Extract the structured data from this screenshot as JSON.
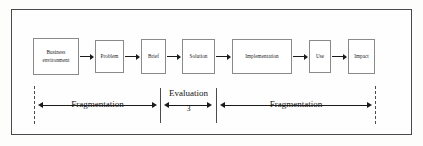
{
  "diagram": {
    "frame_color": "#4a4a4a",
    "line_color": "#1b1b1b",
    "stages": [
      {
        "id": "business-environment",
        "label_line1": "Business",
        "label_line2": "environment",
        "x": 33,
        "y": 38,
        "w": 46,
        "h": 37
      },
      {
        "id": "problem",
        "label_line1": "Problem",
        "label_line2": "",
        "x": 95,
        "y": 40,
        "w": 29,
        "h": 33
      },
      {
        "id": "brief",
        "label_line1": "Brief",
        "label_line2": "",
        "x": 141,
        "y": 39,
        "w": 25,
        "h": 35
      },
      {
        "id": "solution",
        "label_line1": "Solution",
        "label_line2": "",
        "x": 182,
        "y": 39,
        "w": 33,
        "h": 35
      },
      {
        "id": "implementation",
        "label_line1": "Implementation",
        "label_line2": "",
        "x": 232,
        "y": 39,
        "w": 60,
        "h": 35
      },
      {
        "id": "use",
        "label_line1": "Use",
        "label_line2": "",
        "x": 309,
        "y": 40,
        "w": 22,
        "h": 33
      },
      {
        "id": "impact",
        "label_line1": "Impact",
        "label_line2": "",
        "x": 348,
        "y": 39,
        "w": 27,
        "h": 35
      }
    ],
    "connectors": [
      {
        "id": "arrow-business-problem",
        "x": 80,
        "y": 52,
        "w": 14
      },
      {
        "id": "arrow-problem-brief",
        "x": 125,
        "y": 52,
        "w": 15
      },
      {
        "id": "arrow-brief-solution",
        "x": 167,
        "y": 52,
        "w": 14
      },
      {
        "id": "arrow-solution-implementation",
        "x": 216,
        "y": 52,
        "w": 15
      },
      {
        "id": "arrow-implementation-use",
        "x": 293,
        "y": 52,
        "w": 15
      },
      {
        "id": "arrow-use-impact",
        "x": 332,
        "y": 52,
        "w": 15
      }
    ],
    "boundaries": [
      {
        "id": "boundary-left-dashed",
        "style": "dashed",
        "x": 34
      },
      {
        "id": "boundary-evaluation-left",
        "style": "solid",
        "x": 160
      },
      {
        "id": "boundary-evaluation-right",
        "style": "solid",
        "x": 216
      },
      {
        "id": "boundary-right-dashed",
        "style": "dashed",
        "x": 375
      }
    ],
    "measures": [
      {
        "id": "measure-fragmentation-left",
        "label": "Fragmentation",
        "sublabel": "",
        "x": 38,
        "y": 100,
        "w": 119,
        "label_x": 47,
        "label_y": 99,
        "label_w": 101
      },
      {
        "id": "measure-evaluation",
        "label": "Evaluation",
        "sublabel": "3",
        "x": 164,
        "y": 100,
        "w": 48,
        "label_x": 160,
        "label_y": 88,
        "label_w": 57,
        "sublabel_x": 160,
        "sublabel_y": 104,
        "sublabel_w": 57
      },
      {
        "id": "measure-fragmentation-right",
        "label": "Fragmentation",
        "sublabel": "",
        "x": 220,
        "y": 100,
        "w": 152,
        "label_x": 243,
        "label_y": 99,
        "label_w": 106
      }
    ]
  }
}
